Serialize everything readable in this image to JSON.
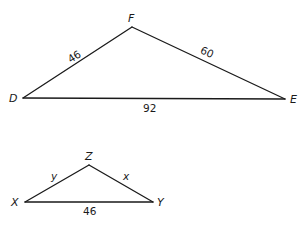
{
  "diagram": {
    "triangle_large": {
      "vertices": {
        "D": {
          "label": "D",
          "x": 23,
          "y": 98
        },
        "F": {
          "label": "F",
          "x": 132,
          "y": 27
        },
        "E": {
          "label": "E",
          "x": 285,
          "y": 99
        }
      },
      "sides": {
        "DF": {
          "label": "46"
        },
        "FE": {
          "label": "60"
        },
        "DE": {
          "label": "92"
        }
      }
    },
    "triangle_small": {
      "vertices": {
        "X": {
          "label": "X",
          "x": 25,
          "y": 202
        },
        "Z": {
          "label": "Z",
          "x": 89,
          "y": 165
        },
        "Y": {
          "label": "Y",
          "x": 153,
          "y": 202
        }
      },
      "sides": {
        "XZ": {
          "label": "y"
        },
        "ZY": {
          "label": "x"
        },
        "XY": {
          "label": "46"
        }
      }
    },
    "colors": {
      "line": "#1a1a1a",
      "background": "#ffffff"
    }
  }
}
